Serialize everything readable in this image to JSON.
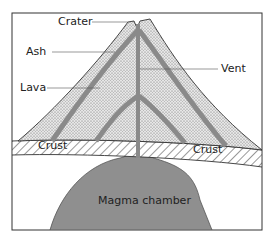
{
  "diagram": {
    "labels": {
      "crater": "Crater",
      "ash": "Ash",
      "lava": "Lava",
      "vent": "Vent",
      "crust_left": "Crust",
      "crust_right": "Crust",
      "magma_chamber": "Magma chamber"
    },
    "colors": {
      "ash_fill": "#d8d8d8",
      "lava": "#8c8c8c",
      "magma": "#8f8f8f",
      "outline": "#3a3a3a",
      "background": "#ffffff"
    }
  }
}
